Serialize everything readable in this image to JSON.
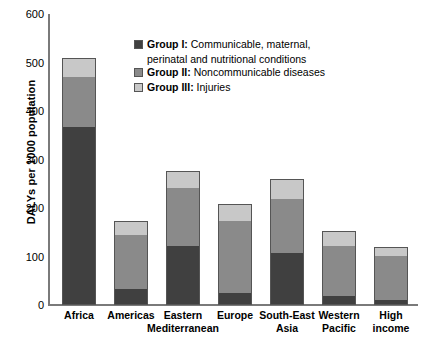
{
  "chart_data": {
    "type": "bar",
    "subtype": "stacked-vertical",
    "title": "",
    "xlabel": "",
    "ylabel": "DALYs per 1000 population",
    "ylim": [
      0,
      600
    ],
    "yticks": [
      0,
      100,
      200,
      300,
      400,
      500,
      600
    ],
    "ytick_labels": [
      "0",
      "100",
      "200",
      "300",
      "400",
      "500",
      "600"
    ],
    "grid": false,
    "legend_position": "inside-top-left",
    "categories": [
      "Africa",
      "Americas",
      "Eastern\nMediterranean",
      "Europe",
      "South-East\nAsia",
      "Western\nPacific",
      "High\nincome"
    ],
    "series": [
      {
        "name": "Group I",
        "label": "Group I: Communicable, maternal, perinatal and nutritional conditions",
        "color": "#404040",
        "values": [
          368,
          31,
          121,
          23,
          106,
          17,
          8
        ]
      },
      {
        "name": "Group II",
        "label": "Group II: Noncommunicable diseases",
        "color": "#8a8a8a",
        "values": [
          104,
          115,
          121,
          152,
          115,
          106,
          94
        ]
      },
      {
        "name": "Group III",
        "label": "Group III: Injuries",
        "color": "#c8c8c8",
        "values": [
          38,
          27,
          35,
          33,
          39,
          29,
          17
        ]
      }
    ],
    "totals": [
      510,
      173,
      277,
      208,
      260,
      152,
      119
    ]
  },
  "legend": {
    "items": [
      {
        "name": "Group I:",
        "desc": " Communicable, maternal,",
        "cont": "perinatal and nutritional conditions",
        "color": "#404040"
      },
      {
        "name": "Group II:",
        "desc": " Noncommunicable diseases",
        "cont": "",
        "color": "#8a8a8a"
      },
      {
        "name": "Group III:",
        "desc": " Injuries",
        "cont": "",
        "color": "#c8c8c8"
      }
    ]
  },
  "axis": {
    "y_title": "DALYs per 1000 population"
  }
}
